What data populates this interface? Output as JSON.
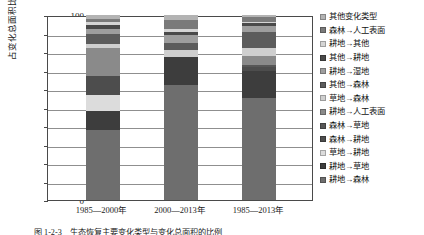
{
  "chart_data": {
    "type": "bar",
    "subtype": "stacked-bar-100-percent",
    "title": "",
    "xlabel": "",
    "ylabel": "占变化总面积比例/%",
    "ylim": [
      0,
      100
    ],
    "ytick_step": 10,
    "yticks": [
      "0",
      "10",
      "20",
      "30",
      "40",
      "50",
      "60",
      "70",
      "80",
      "90",
      "100"
    ],
    "grid": true,
    "legend_position": "right",
    "categories": [
      "1985—2000年",
      "2000—2013年",
      "1985—2013年"
    ],
    "series": [
      {
        "name": "耕地→森林",
        "color": "#6e6e6e",
        "values": [
          38.0,
          62.0,
          55.0
        ]
      },
      {
        "name": "耕地→草地",
        "color": "#3d3d3d",
        "values": [
          10.0,
          15.5,
          15.0
        ]
      },
      {
        "name": "草地→耕地",
        "color": "#dcdcdc",
        "values": [
          9.0,
          0.0,
          0.0
        ]
      },
      {
        "name": "森林→耕地",
        "color": "#4d4d4d",
        "values": [
          10.0,
          0.0,
          2.0
        ]
      },
      {
        "name": "森林→草地",
        "color": "#575757",
        "values": [
          0.0,
          0.0,
          1.0
        ]
      },
      {
        "name": "耕地→人工表面",
        "color": "#8a8a8a",
        "values": [
          15.0,
          0.0,
          5.0
        ]
      },
      {
        "name": "草地→森林",
        "color": "#cfcfcf",
        "values": [
          2.5,
          3.5,
          4.0
        ]
      },
      {
        "name": "其他→森林",
        "color": "#5c5c5c",
        "values": [
          5.0,
          4.0,
          9.0
        ]
      },
      {
        "name": "耕地→湿地",
        "color": "#9e9e9e",
        "values": [
          3.0,
          4.0,
          3.0
        ]
      },
      {
        "name": "其他→耕地",
        "color": "#4a4a4a",
        "values": [
          2.0,
          2.0,
          1.5
        ]
      },
      {
        "name": "耕地→其他",
        "color": "#d5d5d5",
        "values": [
          1.5,
          1.5,
          1.0
        ]
      },
      {
        "name": "森林→人工表面",
        "color": "#7a7a7a",
        "values": [
          2.0,
          5.0,
          2.5
        ]
      },
      {
        "name": "其他变化类型",
        "color": "#b3b3b3",
        "values": [
          2.0,
          2.5,
          1.0
        ]
      }
    ]
  },
  "axis": {
    "y_title": "占变化总面积比例/%",
    "x_categories": [
      "1985—2000年",
      "2000—2013年",
      "1985—2013年"
    ]
  },
  "legend": {
    "items": [
      {
        "label": "其他变化类型",
        "color": "#b3b3b3"
      },
      {
        "label": "森林→人工表面",
        "color": "#7a7a7a"
      },
      {
        "label": "耕地→其他",
        "color": "#d5d5d5"
      },
      {
        "label": "其他→耕地",
        "color": "#4a4a4a"
      },
      {
        "label": "耕地→湿地",
        "color": "#9e9e9e"
      },
      {
        "label": "其他→森林",
        "color": "#5c5c5c"
      },
      {
        "label": "草地→森林",
        "color": "#cfcfcf"
      },
      {
        "label": "耕地→人工表面",
        "color": "#8a8a8a"
      },
      {
        "label": "森林→草地",
        "color": "#575757"
      },
      {
        "label": "森林→耕地",
        "color": "#4d4d4d"
      },
      {
        "label": "草地→耕地",
        "color": "#dcdcdc"
      },
      {
        "label": "耕地→草地",
        "color": "#3d3d3d"
      },
      {
        "label": "耕地→森林",
        "color": "#6e6e6e"
      }
    ]
  },
  "caption": {
    "text": "图 1-2-3　生态恢复主要变化类型与变化总面积的比例"
  }
}
